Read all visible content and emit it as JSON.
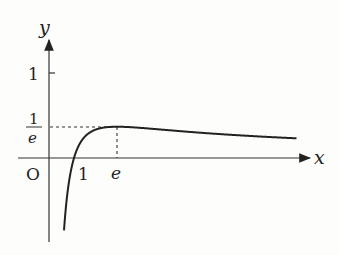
{
  "chart_data": {
    "type": "line",
    "title": "",
    "function": "y = ln(x)/x",
    "xlabel": "x",
    "ylabel": "y",
    "origin_label": "O",
    "x_ticks": [
      {
        "value": 1,
        "label": "1"
      },
      {
        "value": 2.718,
        "label": "e"
      }
    ],
    "y_ticks": [
      {
        "value": 1,
        "label": "1"
      },
      {
        "value": 0.3679,
        "label_num": "1",
        "label_den": "e"
      }
    ],
    "max_point": {
      "x": 2.718,
      "y": 0.3679
    },
    "grid": false,
    "series": [
      {
        "name": "f(x)",
        "x": [
          0.55,
          0.7,
          0.85,
          1,
          1.3,
          1.7,
          2.2,
          2.718,
          3.5,
          5,
          7,
          9.9
        ],
        "values": [
          -1.087,
          -0.51,
          -0.191,
          0,
          0.202,
          0.312,
          0.358,
          0.368,
          0.358,
          0.322,
          0.278,
          0.232
        ]
      }
    ],
    "colors": {
      "line": "#222222",
      "background": "#fdfdfb"
    }
  }
}
